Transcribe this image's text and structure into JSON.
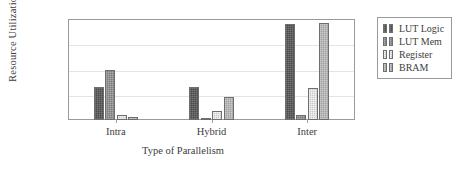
{
  "chart_data": {
    "type": "bar",
    "title": "",
    "xlabel": "Type of Parallelism",
    "ylabel": "Resource Utilization (%)",
    "categories": [
      "Intra",
      "Hybrid",
      "Inter"
    ],
    "ylim": [
      0,
      80
    ],
    "yticks": [
      "0%",
      "20%",
      "40%",
      "60%",
      "80%"
    ],
    "ytick_values": [
      0,
      20,
      40,
      60,
      80
    ],
    "grid": true,
    "legend_position": "outside-right-top",
    "series": [
      {
        "name": "LUT Logic",
        "color": "#4a4a4a",
        "values": [
          26,
          26,
          76
        ]
      },
      {
        "name": "LUT Mem",
        "color": "#7d7d7d",
        "values": [
          40,
          1,
          4
        ]
      },
      {
        "name": "Register",
        "color": "#c9c9c9",
        "values": [
          4,
          7,
          25
        ]
      },
      {
        "name": "BRAM",
        "color": "#a0a0a0",
        "values": [
          2,
          18,
          77
        ]
      }
    ]
  },
  "legend": {
    "items": [
      {
        "label": "LUT Logic"
      },
      {
        "label": "LUT Mem"
      },
      {
        "label": "Register"
      },
      {
        "label": "BRAM"
      }
    ]
  }
}
